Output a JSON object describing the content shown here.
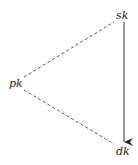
{
  "diagram": {
    "nodes": [
      {
        "id": "sk",
        "label": "sk",
        "x": 119,
        "y": 18
      },
      {
        "id": "pk",
        "label": "pk",
        "x": 14,
        "y": 85
      },
      {
        "id": "dk",
        "label": "dk",
        "x": 119,
        "y": 152
      }
    ],
    "edges": [
      {
        "from": "pk",
        "to": "sk",
        "style": "dashed",
        "arrow": false
      },
      {
        "from": "pk",
        "to": "dk",
        "style": "dashed",
        "arrow": false
      },
      {
        "from": "sk",
        "to": "dk",
        "style": "solid",
        "arrow": true
      }
    ],
    "colors": {
      "line": "#333333",
      "text": "#222222",
      "background": "#ffffff"
    }
  }
}
